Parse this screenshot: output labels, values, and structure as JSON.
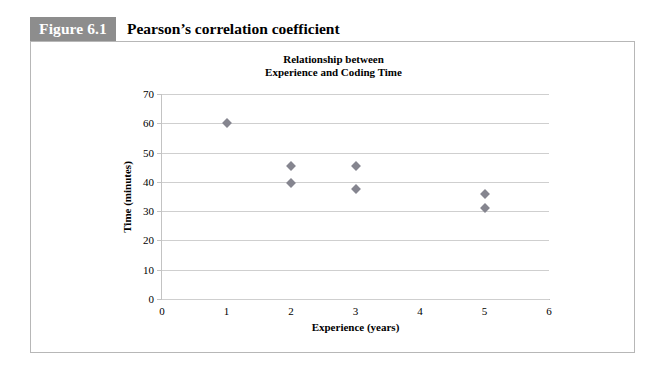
{
  "figure": {
    "badge": "Figure 6.1",
    "caption": "Pearson’s correlation coefficient"
  },
  "chart_data": {
    "type": "scatter",
    "title": "Relationship between Experience and Coding Time",
    "title_lines": [
      "Relationship between",
      "Experience and Coding Time"
    ],
    "xlabel": "Experience (years)",
    "ylabel": "Time (minutes)",
    "xlim": [
      0,
      6
    ],
    "ylim": [
      0,
      70
    ],
    "xticks": [
      0,
      1,
      2,
      3,
      4,
      5,
      6
    ],
    "yticks": [
      0,
      10,
      20,
      30,
      40,
      50,
      60,
      70
    ],
    "xtick_labels": [
      "0",
      "1",
      "2",
      "3",
      "4",
      "5",
      "6"
    ],
    "ytick_labels": [
      "0",
      "10",
      "20",
      "30",
      "40",
      "50",
      "60",
      "70"
    ],
    "grid": "horizontal",
    "legend": "none",
    "marker": "diamond",
    "marker_color": "#85858f",
    "points": [
      {
        "x": 1,
        "y": 60
      },
      {
        "x": 2,
        "y": 45.5
      },
      {
        "x": 2,
        "y": 39.5
      },
      {
        "x": 3,
        "y": 45.5
      },
      {
        "x": 3,
        "y": 37.5
      },
      {
        "x": 5,
        "y": 36
      },
      {
        "x": 5,
        "y": 31
      }
    ]
  },
  "colors": {
    "badge_background": "#8d8d8d",
    "badge_text": "#ffffff",
    "frame_border": "#b7b7b7",
    "gridline": "#cfcfcf",
    "marker": "#85858f"
  }
}
